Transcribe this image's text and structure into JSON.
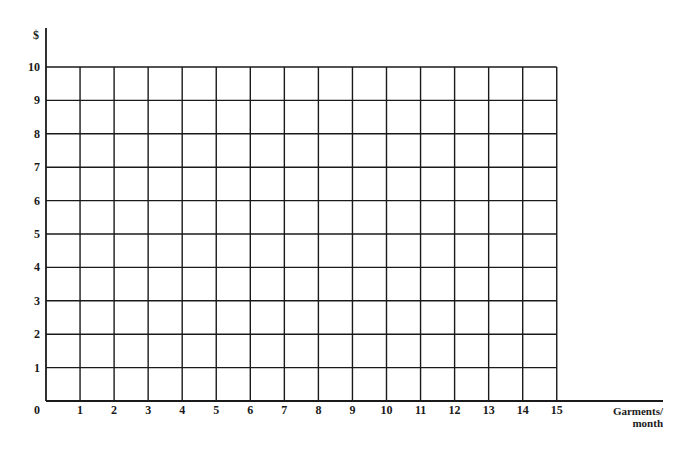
{
  "chart_data": {
    "type": "line",
    "title": "",
    "xlabel": "Garments/ month",
    "xlabel_lines": [
      "Garments/",
      "month"
    ],
    "ylabel": "$",
    "x_ticks": [
      0,
      1,
      2,
      3,
      4,
      5,
      6,
      7,
      8,
      9,
      10,
      11,
      12,
      13,
      14,
      15
    ],
    "y_ticks": [
      0,
      1,
      2,
      3,
      4,
      5,
      6,
      7,
      8,
      9,
      10
    ],
    "xlim": [
      0,
      15
    ],
    "ylim": [
      0,
      10
    ],
    "grid": true,
    "series": [],
    "legend": null,
    "note": "Blank graph-paper grid; no data plotted"
  },
  "colors": {
    "line": "#1a1a1a",
    "background": "#ffffff"
  }
}
